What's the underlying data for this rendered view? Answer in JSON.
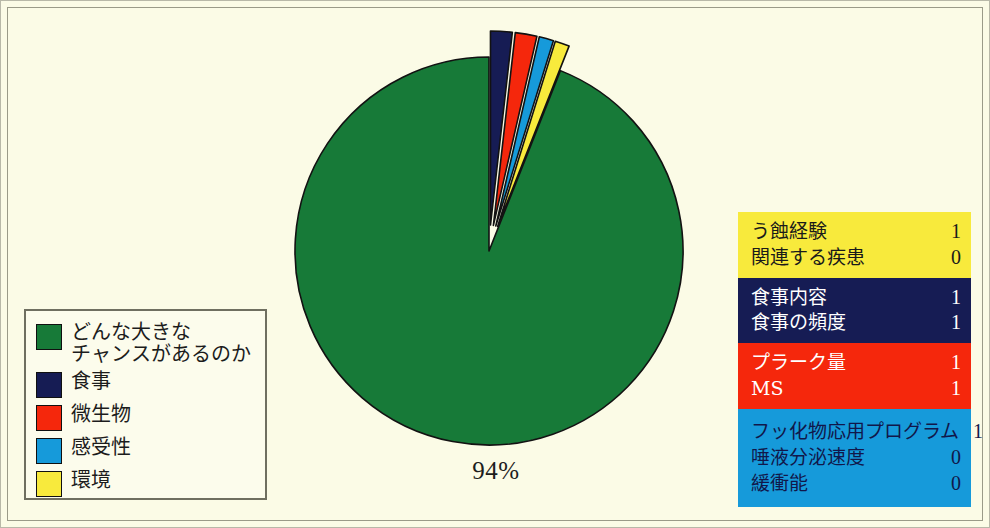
{
  "figure": {
    "background_color": "#fbfbe6",
    "total_label": "94%"
  },
  "chart_data": {
    "type": "pie",
    "title": "",
    "labels": [
      "どんな大きな\nチャンスがあるのか",
      "食事",
      "微生物",
      "感受性",
      "環境"
    ],
    "values": [
      94,
      1.8,
      1.8,
      1.2,
      1.2
    ],
    "colors": [
      "#177a38",
      "#161c54",
      "#f5270c",
      "#169ada",
      "#f8ea3c"
    ],
    "exploded": [
      false,
      true,
      true,
      true,
      true
    ],
    "data_labels": [
      "94%",
      "",
      "",
      "",
      ""
    ],
    "legend_position": "bottom-left",
    "grid": false
  },
  "legend": {
    "items": [
      {
        "label": "どんな大きな\nチャンスがあるのか",
        "color": "#177a38"
      },
      {
        "label": "食事",
        "color": "#161c54"
      },
      {
        "label": "微生物",
        "color": "#f5270c"
      },
      {
        "label": "感受性",
        "color": "#169ada"
      },
      {
        "label": "環境",
        "color": "#f8ea3c"
      }
    ]
  },
  "risk_table": {
    "groups": [
      {
        "color": "#f8ea3c",
        "text_color": "#1a1a1a",
        "rows": [
          {
            "name": "う蝕経験",
            "value": "1"
          },
          {
            "name": "関連する疾患",
            "value": "0"
          }
        ]
      },
      {
        "color": "#161c54",
        "text_color": "#ffffff",
        "rows": [
          {
            "name": "食事内容",
            "value": "1"
          },
          {
            "name": "食事の頻度",
            "value": "1"
          }
        ]
      },
      {
        "color": "#f5270c",
        "text_color": "#ffffff",
        "rows": [
          {
            "name": "プラーク量",
            "value": "1"
          },
          {
            "name": "MS",
            "value": "1"
          }
        ]
      },
      {
        "color": "#169ada",
        "text_color": "#11174a",
        "rows": [
          {
            "name": "フッ化物応用プログラム",
            "value": "1"
          },
          {
            "name": "唾液分泌速度",
            "value": "0"
          },
          {
            "name": "緩衝能",
            "value": "0"
          }
        ]
      }
    ]
  }
}
